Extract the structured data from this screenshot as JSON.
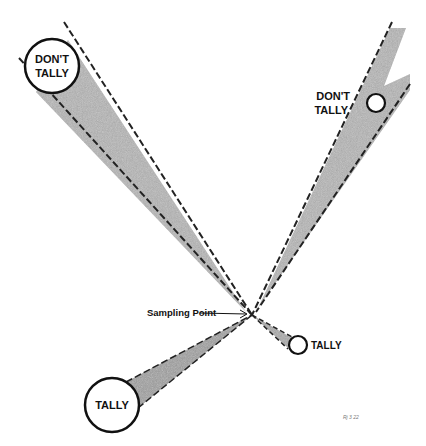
{
  "diagram": {
    "type": "sampling-point-tally-diagram",
    "colors": {
      "background": "#ffffff",
      "beam_fill": "#b9b9b9",
      "line": "#111111"
    },
    "sampling_point": {
      "label": "Sampling Point",
      "x": 252,
      "y": 315
    },
    "trees": [
      {
        "id": "top-left",
        "label_line1": "DON'T",
        "label_line2": "TALLY",
        "cx": 52,
        "cy": 66,
        "r": 27,
        "label_inside": true
      },
      {
        "id": "top-right",
        "label_line1": "DON'T",
        "label_line2": "TALLY",
        "cx": 376,
        "cy": 103,
        "r": 9,
        "label_inside": false
      },
      {
        "id": "bottom-left",
        "label_line1": "TALLY",
        "cx": 112,
        "cy": 405,
        "r": 27,
        "label_inside": true
      },
      {
        "id": "right-small",
        "label_line1": "TALLY",
        "cx": 298,
        "cy": 345,
        "r": 9,
        "label_inside": false
      }
    ],
    "footnote": "Rj 3 22"
  }
}
